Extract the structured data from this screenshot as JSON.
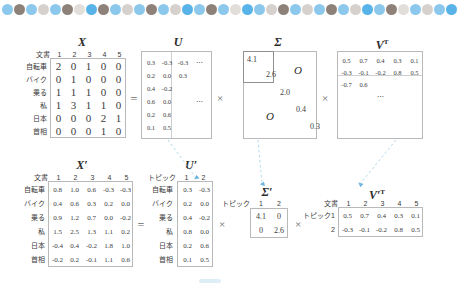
{
  "figure": {
    "title_x": "X",
    "title_u": "U",
    "title_sigma": "Σ",
    "title_vt": "V",
    "vt_sup": "T",
    "title_x_prime": "X′",
    "title_u_prime": "U′",
    "title_sigma_prime": "Σ′",
    "title_vt_prime": "V′",
    "equals": "=",
    "times": "×",
    "ellipsis_h": "⋯",
    "ellipsis_d": "⋯",
    "zero_block": "O",
    "doc_label": "文書",
    "topic_label": "トピック"
  },
  "colors": {
    "band_blue_light": "#8CC8EC",
    "band_blue_bright": "#58B4E8",
    "band_brown": "#8E817A",
    "band_gray": "#D6D1CD",
    "band_gray_light": "#E2DEDA",
    "arrow_blue": "#6FB6E0",
    "box_border": "#b9b9b9",
    "text": "#3c3c3c"
  },
  "matrix_x": {
    "name": "X",
    "col_header_label": "文書",
    "columns": [
      "1",
      "2",
      "3",
      "4",
      "5"
    ],
    "rows": [
      "自転車",
      "バイク",
      "乗る",
      "私",
      "日本",
      "首相"
    ],
    "values": [
      [
        "2",
        "0",
        "1",
        "0",
        "0"
      ],
      [
        "0",
        "1",
        "0",
        "0",
        "0"
      ],
      [
        "1",
        "1",
        "1",
        "0",
        "0"
      ],
      [
        "1",
        "3",
        "1",
        "1",
        "0"
      ],
      [
        "0",
        "0",
        "0",
        "2",
        "1"
      ],
      [
        "0",
        "0",
        "0",
        "1",
        "0"
      ]
    ]
  },
  "matrix_u": {
    "name": "U",
    "values": [
      [
        "0.3",
        "-0.3",
        "-0.3",
        "⋯"
      ],
      [
        "0.2",
        "0.0",
        "0.3",
        ""
      ],
      [
        "0.4",
        "-0.2",
        "",
        ""
      ],
      [
        "0.6",
        "0.0",
        "",
        "⋯"
      ],
      [
        "0.2",
        "0.6",
        "",
        ""
      ],
      [
        "0.1",
        "0.5",
        "",
        ""
      ]
    ]
  },
  "matrix_sigma": {
    "name": "Σ",
    "diagonal": [
      "4.1",
      "2.6",
      "2.0",
      "0.4",
      "0.3"
    ],
    "zero_blocks": [
      "O",
      "O"
    ]
  },
  "matrix_vt": {
    "name": "V",
    "superscript": "T",
    "values": [
      [
        "0.5",
        "0.7",
        "0.4",
        "0.3",
        "0.1"
      ],
      [
        "-0.3",
        "-0.1",
        "-0.2",
        "0.8",
        "0.5"
      ],
      [
        "-0.7",
        "0.6",
        "",
        "",
        ""
      ],
      [
        "",
        "",
        "⋯",
        "",
        ""
      ]
    ]
  },
  "matrix_x_prime": {
    "name": "X′",
    "col_header_label": "文書",
    "columns": [
      "1",
      "2",
      "3",
      "4",
      "5"
    ],
    "rows": [
      "自転車",
      "バイク",
      "乗る",
      "私",
      "日本",
      "首相"
    ],
    "values": [
      [
        "0.8",
        "1.0",
        "0.6",
        "-0.3",
        "-0.3"
      ],
      [
        "0.4",
        "0.6",
        "0.3",
        "0.2",
        "0.0"
      ],
      [
        "0.9",
        "1.2",
        "0.7",
        "0.0",
        "-0.2"
      ],
      [
        "1.5",
        "2.5",
        "1.3",
        "1.1",
        "0.2"
      ],
      [
        "-0.4",
        "0.4",
        "-0.2",
        "1.8",
        "1.0"
      ],
      [
        "-0.2",
        "0.2",
        "-0.1",
        "1.1",
        "0.6"
      ]
    ]
  },
  "matrix_u_prime": {
    "name": "U′",
    "col_header_label": "トピック",
    "columns": [
      "1",
      "2"
    ],
    "rows": [
      "自転車",
      "バイク",
      "乗る",
      "私",
      "日本",
      "首相"
    ],
    "values": [
      [
        "0.3",
        "-0.3"
      ],
      [
        "0.2",
        "0.0"
      ],
      [
        "0.4",
        "-0.2"
      ],
      [
        "0.8",
        "0.0"
      ],
      [
        "0.2",
        "0.6"
      ],
      [
        "0.1",
        "0.5"
      ]
    ]
  },
  "matrix_sigma_prime": {
    "name": "Σ′",
    "col_header_label": "トピック",
    "columns": [
      "1",
      "2"
    ],
    "values": [
      [
        "4.1",
        "0"
      ],
      [
        "0",
        "2.6"
      ]
    ]
  },
  "matrix_vt_prime": {
    "name": "V′",
    "superscript": "T",
    "col_header_label": "文書",
    "columns": [
      "1",
      "2",
      "3",
      "4",
      "5"
    ],
    "row_header_label": "トピック",
    "rows": [
      "1",
      "2"
    ],
    "values": [
      [
        "0.5",
        "0.7",
        "0.4",
        "0.3",
        "0.1"
      ],
      [
        "-0.3",
        "-0.1",
        "-0.2",
        "0.8",
        "0.5"
      ]
    ]
  },
  "dot_band": {
    "count": 38,
    "sequence": [
      "light",
      "brown",
      "light",
      "gray",
      "light",
      "brown",
      "lightgray",
      "bright",
      "brown",
      "light",
      "gray",
      "light",
      "brown",
      "light",
      "gray",
      "bright",
      "light",
      "brown",
      "light",
      "lightgray",
      "bright",
      "light",
      "gray",
      "brown",
      "light",
      "gray",
      "light",
      "brown",
      "light",
      "gray",
      "bright",
      "light",
      "brown",
      "lightgray",
      "light",
      "gray",
      "light",
      "bright"
    ]
  }
}
